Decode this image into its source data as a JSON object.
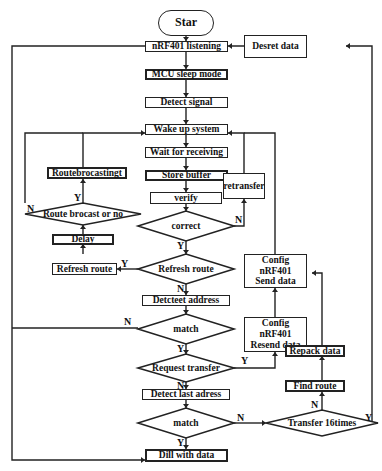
{
  "diagram": {
    "type": "flowchart",
    "start": {
      "label": "Star"
    },
    "processes": {
      "listening": "nRF401 listening",
      "sleep": "MCU sleep mode",
      "detect_signal": "Detect  signal",
      "wake": "Wake up system",
      "wait": "Wait for receiving",
      "store": "Store buffer",
      "verify": "verify",
      "retransfer": "retransfer",
      "route_broadcasting": "Routebrocastingt",
      "delay": "Delay",
      "refresh_route_box": "Refresh route",
      "detect_address": "Detcteet address",
      "detect_last": "Detect last adress",
      "deal": "Dill with data",
      "desret": "Desret data",
      "config_send": "Config nRF401\nSend data",
      "config_send_l1": "Config nRF401",
      "config_send_l2": "Send data",
      "config_resend_l1": "Config nRF401",
      "config_resend_l2": "Resend data",
      "repack": "Repack data",
      "find_route": "Find route"
    },
    "decisions": {
      "route_broadcast": "Route brocast or no",
      "correct": "correct",
      "refresh_route": "Refresh route",
      "match1": "match",
      "request_transfer": "Request transfer",
      "match2": "match",
      "transfer16": "Transfer 16times"
    },
    "edge_labels": {
      "y": "Y",
      "n": "N"
    },
    "colors": {
      "stroke": "#222222",
      "fill": "#ffffff",
      "text": "#111111"
    }
  }
}
